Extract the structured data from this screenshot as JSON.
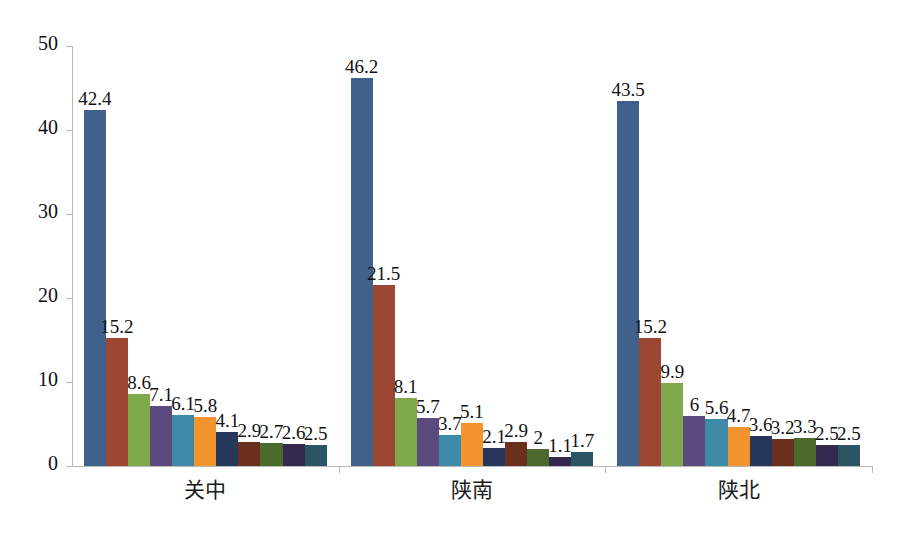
{
  "chart_data": {
    "type": "bar",
    "title": "",
    "subtitle": "",
    "xlabel": "",
    "ylabel": "",
    "ylim": [
      0,
      50
    ],
    "ytick_labels": [
      "0",
      "10",
      "20",
      "30",
      "40",
      "50"
    ],
    "yticks": [
      0,
      10,
      20,
      30,
      40,
      50
    ],
    "grid": false,
    "legend": "none",
    "categories": [
      "关中",
      "陕南",
      "陕北"
    ],
    "series_colors": [
      "#40618c",
      "#9b4733",
      "#7fa94a",
      "#5a4a7d",
      "#3c8aa8",
      "#f4942f",
      "#26375c",
      "#6b2f1e",
      "#4a6b2c",
      "#332a4d",
      "#2a5563"
    ],
    "groups": [
      {
        "name": "关中",
        "values": [
          42.4,
          15.2,
          8.6,
          7.1,
          6.1,
          5.8,
          4.1,
          2.9,
          2.7,
          2.6,
          2.5
        ],
        "labels": [
          "42.4",
          "15.2",
          "8.6",
          "7.1",
          "6.1",
          "5.8",
          "4.1",
          "2.9",
          "2.7",
          "2.6",
          "2.5"
        ]
      },
      {
        "name": "陕南",
        "values": [
          46.2,
          21.5,
          8.1,
          5.7,
          3.7,
          5.1,
          2.1,
          2.9,
          2.0,
          1.1,
          1.7
        ],
        "labels": [
          "46.2",
          "21.5",
          "8.1",
          "5.7",
          "3.7",
          "5.1",
          "2.1",
          "2.9",
          "2",
          "1.1",
          "1.7"
        ]
      },
      {
        "name": "陕北",
        "values": [
          43.5,
          15.2,
          9.9,
          6.0,
          5.6,
          4.7,
          3.6,
          3.2,
          3.3,
          2.5,
          2.5
        ],
        "labels": [
          "43.5",
          "15.2",
          "9.9",
          "6",
          "5.6",
          "4.7",
          "3.6",
          "3.2",
          "3.3",
          "2.5",
          "2.5"
        ]
      }
    ],
    "axis_color": "#b8b8b8",
    "background": "#ffffff"
  }
}
